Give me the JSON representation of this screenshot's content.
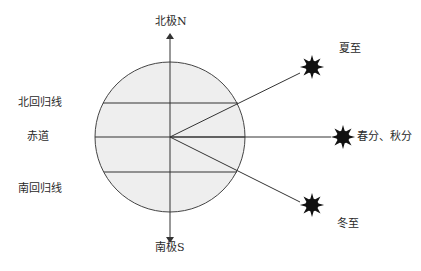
{
  "diagram": {
    "type": "earth-sun-angles",
    "axis": {
      "north_label": "北极N",
      "south_label": "南极S"
    },
    "latitudes": {
      "tropic_of_cancer": "北回归线",
      "equator": "赤道",
      "tropic_of_capricorn": "南回归线"
    },
    "suns": {
      "summer_solstice": "夏至",
      "equinox": "春分、秋分",
      "winter_solstice": "冬至"
    },
    "colors": {
      "earth_fill": "#eeeeee",
      "line": "#333333",
      "sun": "#111111"
    }
  }
}
